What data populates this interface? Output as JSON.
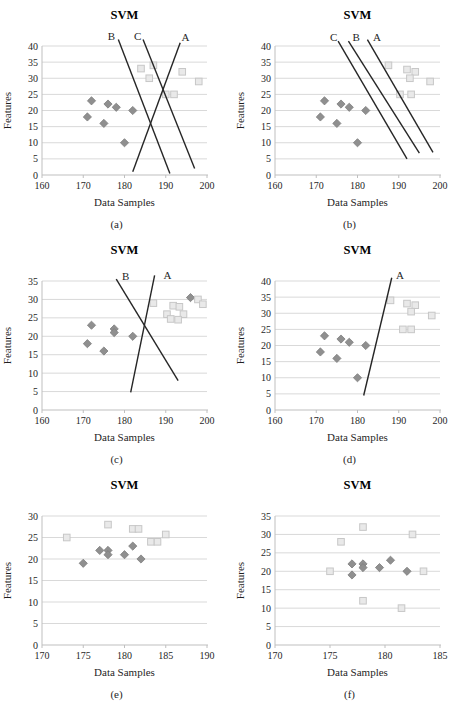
{
  "figure": {
    "shared_title": "SVM",
    "shared_xlabel": "Data Samples",
    "shared_ylabel": "Features"
  },
  "colors": {
    "background": "#ffffff",
    "diamond_fill": "#8f8f8f",
    "diamond_stroke": "#7d7d7d",
    "square_fill": "#e9e9e9",
    "square_stroke": "#c7c7c7",
    "gridline": "#d9d9d9",
    "axis": "#bfbfbf",
    "separator_line": "#262626",
    "text": "#1f1f1f",
    "title": "#000000"
  },
  "chart_data": [
    {
      "type": "scatter",
      "caption": "(a)",
      "title": "SVM",
      "xlabel": "Data Samples",
      "ylabel": "Features",
      "xlim": [
        160,
        200
      ],
      "xticks": [
        160,
        170,
        180,
        190,
        200
      ],
      "ylim": [
        0,
        40
      ],
      "yticks": [
        0,
        5,
        10,
        15,
        20,
        25,
        30,
        35,
        40
      ],
      "grid": true,
      "legend": "none",
      "series": [
        {
          "name": "Class 1",
          "marker": "diamond",
          "points": [
            [
              172,
              23
            ],
            [
              176,
              22
            ],
            [
              178,
              21
            ],
            [
              171,
              18
            ],
            [
              175,
              16
            ],
            [
              182,
              20
            ],
            [
              180,
              10
            ]
          ]
        },
        {
          "name": "Class 2",
          "marker": "square",
          "points": [
            [
              184,
              33
            ],
            [
              187,
              34
            ],
            [
              186,
              30
            ],
            [
              194,
              32
            ],
            [
              198,
              29
            ],
            [
              190,
              25
            ],
            [
              192,
              25
            ]
          ]
        }
      ],
      "separator_lines": [
        {
          "label": "B",
          "from": [
            178.5,
            42
          ],
          "to": [
            191,
            0.5
          ],
          "label_at": [
            176.8,
            43
          ]
        },
        {
          "label": "C",
          "from": [
            184.5,
            42
          ],
          "to": [
            197,
            2
          ],
          "label_at": [
            183.2,
            43
          ]
        },
        {
          "label": "A",
          "from": [
            193.5,
            41
          ],
          "to": [
            182,
            1
          ],
          "label_at": [
            194.8,
            42.6
          ]
        }
      ]
    },
    {
      "type": "scatter",
      "caption": "(b)",
      "title": "SVM",
      "xlabel": "Data Samples",
      "ylabel": "Features",
      "xlim": [
        160,
        200
      ],
      "xticks": [
        160,
        170,
        180,
        190,
        200
      ],
      "ylim": [
        0,
        40
      ],
      "yticks": [
        0,
        5,
        10,
        15,
        20,
        25,
        30,
        35,
        40
      ],
      "grid": true,
      "legend": "none",
      "series": [
        {
          "name": "Class 1",
          "marker": "diamond",
          "points": [
            [
              172,
              23
            ],
            [
              176,
              22
            ],
            [
              178,
              21
            ],
            [
              171,
              18
            ],
            [
              175,
              16
            ],
            [
              182,
              20
            ],
            [
              180,
              10
            ]
          ]
        },
        {
          "name": "Class 2",
          "marker": "square",
          "points": [
            [
              187.5,
              34
            ],
            [
              192,
              32.7
            ],
            [
              194,
              32
            ],
            [
              192.7,
              30
            ],
            [
              197.6,
              29
            ],
            [
              190.3,
              25
            ],
            [
              193,
              25
            ]
          ]
        }
      ],
      "separator_lines": [
        {
          "label": "C",
          "from": [
            175.3,
            41.5
          ],
          "to": [
            192,
            5
          ],
          "label_at": [
            174.2,
            42.5
          ]
        },
        {
          "label": "B",
          "from": [
            177.8,
            41.5
          ],
          "to": [
            195,
            6.8
          ],
          "label_at": [
            179.7,
            42.5
          ]
        },
        {
          "label": "A",
          "from": [
            182.4,
            42
          ],
          "to": [
            198.3,
            7
          ],
          "label_at": [
            184.7,
            42.6
          ]
        }
      ]
    },
    {
      "type": "scatter",
      "caption": "(c)",
      "title": "SVM",
      "xlabel": "Data Samples",
      "ylabel": "Features",
      "xlim": [
        160,
        200
      ],
      "xticks": [
        160,
        170,
        180,
        190,
        200
      ],
      "ylim": [
        0,
        35
      ],
      "yticks": [
        0,
        5,
        10,
        15,
        20,
        25,
        30,
        35
      ],
      "grid": true,
      "legend": "none",
      "series": [
        {
          "name": "Class 1",
          "marker": "diamond",
          "points": [
            [
              172,
              23
            ],
            [
              177.5,
              22
            ],
            [
              177.5,
              21
            ],
            [
              171,
              18
            ],
            [
              175,
              16
            ],
            [
              182,
              20
            ],
            [
              196,
              30.5
            ]
          ]
        },
        {
          "name": "Class 2",
          "marker": "square",
          "points": [
            [
              187,
              29
            ],
            [
              191.8,
              28.3
            ],
            [
              193.3,
              28
            ],
            [
              190.3,
              26
            ],
            [
              194.3,
              26
            ],
            [
              191.2,
              24.7
            ],
            [
              193,
              24.5
            ],
            [
              197.8,
              30
            ],
            [
              199,
              28.7
            ]
          ]
        }
      ],
      "separator_lines": [
        {
          "label": "B",
          "from": [
            178,
            35.5
          ],
          "to": [
            193,
            8
          ],
          "label_at": [
            180.3,
            36.3
          ]
        },
        {
          "label": "A",
          "from": [
            187.3,
            36.5
          ],
          "to": [
            181.5,
            4.8
          ],
          "label_at": [
            190.4,
            36.5
          ]
        }
      ]
    },
    {
      "type": "scatter",
      "caption": "(d)",
      "title": "SVM",
      "xlabel": "Data Samples",
      "ylabel": "Features",
      "xlim": [
        160,
        200
      ],
      "xticks": [
        160,
        170,
        180,
        190,
        200
      ],
      "ylim": [
        0,
        40
      ],
      "yticks": [
        0,
        5,
        10,
        15,
        20,
        25,
        30,
        35,
        40
      ],
      "grid": true,
      "legend": "none",
      "series": [
        {
          "name": "Class 1",
          "marker": "diamond",
          "points": [
            [
              172,
              23
            ],
            [
              176,
              22
            ],
            [
              178,
              21
            ],
            [
              171,
              18
            ],
            [
              175,
              16
            ],
            [
              182,
              20
            ],
            [
              180,
              10
            ]
          ]
        },
        {
          "name": "Class 2",
          "marker": "square",
          "points": [
            [
              188,
              34
            ],
            [
              192,
              33
            ],
            [
              194,
              32.5
            ],
            [
              193,
              30.5
            ],
            [
              198,
              29.3
            ],
            [
              191,
              25
            ],
            [
              193,
              25
            ]
          ]
        }
      ],
      "separator_lines": [
        {
          "label": "A",
          "from": [
            188.3,
            41
          ],
          "to": [
            181.5,
            4.5
          ],
          "label_at": [
            190.3,
            41.8
          ]
        }
      ]
    },
    {
      "type": "scatter",
      "caption": "(e)",
      "title": "SVM",
      "xlabel": "Data Samples",
      "ylabel": "Features",
      "xlim": [
        170,
        190
      ],
      "xticks": [
        170,
        175,
        180,
        185,
        190
      ],
      "ylim": [
        0,
        30
      ],
      "yticks": [
        0,
        5,
        10,
        15,
        20,
        25,
        30
      ],
      "grid": true,
      "legend": "none",
      "series": [
        {
          "name": "Class 1",
          "marker": "diamond",
          "points": [
            [
              175,
              19
            ],
            [
              177,
              22
            ],
            [
              178,
              22
            ],
            [
              178,
              21
            ],
            [
              180,
              21
            ],
            [
              181,
              23
            ],
            [
              182,
              20
            ]
          ]
        },
        {
          "name": "Class 2",
          "marker": "square",
          "points": [
            [
              173,
              25
            ],
            [
              178,
              28
            ],
            [
              181,
              27
            ],
            [
              181.7,
              27
            ],
            [
              183.2,
              24
            ],
            [
              184,
              24
            ],
            [
              185,
              25.7
            ]
          ]
        }
      ],
      "separator_lines": []
    },
    {
      "type": "scatter",
      "caption": "(f)",
      "title": "SVM",
      "xlabel": "Data Samples",
      "ylabel": "Features",
      "xlim": [
        170,
        185
      ],
      "xticks": [
        170,
        175,
        180,
        185
      ],
      "ylim": [
        0,
        35
      ],
      "yticks": [
        0,
        5,
        10,
        15,
        20,
        25,
        30,
        35
      ],
      "grid": true,
      "legend": "none",
      "series": [
        {
          "name": "Class 1",
          "marker": "diamond",
          "points": [
            [
              177,
              22
            ],
            [
              178,
              22
            ],
            [
              178,
              21
            ],
            [
              177,
              19
            ],
            [
              179.5,
              21
            ],
            [
              180.5,
              23
            ],
            [
              182,
              20
            ]
          ]
        },
        {
          "name": "Class 2",
          "marker": "square",
          "points": [
            [
              175,
              20
            ],
            [
              176,
              28
            ],
            [
              178,
              32
            ],
            [
              178,
              12
            ],
            [
              181.5,
              10
            ],
            [
              182.5,
              30
            ],
            [
              183.5,
              20
            ]
          ]
        }
      ],
      "separator_lines": []
    }
  ]
}
